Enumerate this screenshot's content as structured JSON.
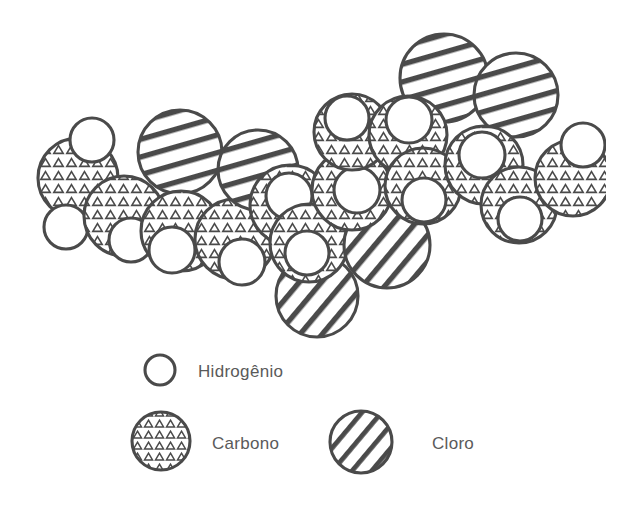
{
  "figure": {
    "title": "",
    "kind": "space-filling molecular model",
    "background_color": "#ffffff",
    "ink_color": "#4a4a4a"
  },
  "legend": {
    "items": [
      {
        "key": "hidrogenio",
        "label": "Hidrogênio",
        "fill_style": "plain",
        "radius": 15,
        "swatch_cx": 160,
        "swatch_cy": 370,
        "label_x": 198,
        "label_y": 377
      },
      {
        "key": "carbono",
        "label": "Carbono",
        "fill_style": "triangles",
        "radius": 29,
        "swatch_cx": 161,
        "swatch_cy": 441,
        "label_x": 212,
        "label_y": 449
      },
      {
        "key": "cloro",
        "label": "Cloro",
        "fill_style": "stripes",
        "radius": 31,
        "swatch_cx": 361,
        "swatch_cy": 442,
        "label_x": 432,
        "label_y": 449
      }
    ]
  },
  "molecule": {
    "atoms": [
      {
        "id": "c1",
        "element": "carbono",
        "cx": 78,
        "cy": 178,
        "r": 40,
        "stripe_angle": 0
      },
      {
        "id": "h1",
        "element": "hidrogenio",
        "cx": 92,
        "cy": 140,
        "r": 22,
        "stripe_angle": 0
      },
      {
        "id": "h2",
        "element": "hidrogenio",
        "cx": 66,
        "cy": 227,
        "r": 22,
        "stripe_angle": 0
      },
      {
        "id": "c2",
        "element": "carbono",
        "cx": 124,
        "cy": 216,
        "r": 40,
        "stripe_angle": 0
      },
      {
        "id": "h3",
        "element": "hidrogenio",
        "cx": 131,
        "cy": 240,
        "r": 22,
        "stripe_angle": 0
      },
      {
        "id": "cl1",
        "element": "cloro",
        "cx": 180,
        "cy": 152,
        "r": 42,
        "stripe_angle": 78
      },
      {
        "id": "c3",
        "element": "carbono",
        "cx": 181,
        "cy": 231,
        "r": 40,
        "stripe_angle": 0
      },
      {
        "id": "h4",
        "element": "hidrogenio",
        "cx": 172,
        "cy": 250,
        "r": 23,
        "stripe_angle": 0
      },
      {
        "id": "c4",
        "element": "carbono",
        "cx": 235,
        "cy": 239,
        "r": 40,
        "stripe_angle": 0
      },
      {
        "id": "h5",
        "element": "hidrogenio",
        "cx": 242,
        "cy": 262,
        "r": 23,
        "stripe_angle": 0
      },
      {
        "id": "cl2",
        "element": "cloro",
        "cx": 258,
        "cy": 170,
        "r": 40,
        "stripe_angle": 76
      },
      {
        "id": "c5",
        "element": "carbono",
        "cx": 290,
        "cy": 205,
        "r": 40,
        "stripe_angle": 0
      },
      {
        "id": "h6",
        "element": "hidrogenio",
        "cx": 289,
        "cy": 196,
        "r": 23,
        "stripe_angle": 0
      },
      {
        "id": "cl3",
        "element": "cloro",
        "cx": 317,
        "cy": 296,
        "r": 41,
        "stripe_angle": 35
      },
      {
        "id": "c6",
        "element": "carbono",
        "cx": 309,
        "cy": 243,
        "r": 39,
        "stripe_angle": 0
      },
      {
        "id": "h7",
        "element": "hidrogenio",
        "cx": 307,
        "cy": 253,
        "r": 22,
        "stripe_angle": 0
      },
      {
        "id": "cl4",
        "element": "cloro",
        "cx": 387,
        "cy": 245,
        "r": 43,
        "stripe_angle": 42
      },
      {
        "id": "c7",
        "element": "carbono",
        "cx": 352,
        "cy": 190,
        "r": 40,
        "stripe_angle": 0
      },
      {
        "id": "h8",
        "element": "hidrogenio",
        "cx": 357,
        "cy": 190,
        "r": 23,
        "stripe_angle": 0
      },
      {
        "id": "c8",
        "element": "carbono",
        "cx": 352,
        "cy": 132,
        "r": 38,
        "stripe_angle": 0
      },
      {
        "id": "h9",
        "element": "hidrogenio",
        "cx": 347,
        "cy": 118,
        "r": 22,
        "stripe_angle": 0
      },
      {
        "id": "cl5",
        "element": "cloro",
        "cx": 444,
        "cy": 78,
        "r": 44,
        "stripe_angle": 74
      },
      {
        "id": "c9",
        "element": "carbono",
        "cx": 408,
        "cy": 135,
        "r": 39,
        "stripe_angle": 0
      },
      {
        "id": "h10",
        "element": "hidrogenio",
        "cx": 409,
        "cy": 120,
        "r": 23,
        "stripe_angle": 0
      },
      {
        "id": "c10",
        "element": "carbono",
        "cx": 423,
        "cy": 186,
        "r": 38,
        "stripe_angle": 0
      },
      {
        "id": "h11",
        "element": "hidrogenio",
        "cx": 424,
        "cy": 200,
        "r": 22,
        "stripe_angle": 0
      },
      {
        "id": "cl6",
        "element": "cloro",
        "cx": 516,
        "cy": 95,
        "r": 42,
        "stripe_angle": 74
      },
      {
        "id": "c11",
        "element": "carbono",
        "cx": 484,
        "cy": 165,
        "r": 39,
        "stripe_angle": 0
      },
      {
        "id": "h12",
        "element": "hidrogenio",
        "cx": 482,
        "cy": 155,
        "r": 23,
        "stripe_angle": 0
      },
      {
        "id": "c12",
        "element": "carbono",
        "cx": 519,
        "cy": 205,
        "r": 38,
        "stripe_angle": 0
      },
      {
        "id": "h13",
        "element": "hidrogenio",
        "cx": 520,
        "cy": 219,
        "r": 22,
        "stripe_angle": 0
      },
      {
        "id": "c13",
        "element": "carbono",
        "cx": 573,
        "cy": 178,
        "r": 38,
        "stripe_angle": 0
      },
      {
        "id": "h14",
        "element": "hidrogenio",
        "cx": 583,
        "cy": 145,
        "r": 22,
        "stripe_angle": 0
      }
    ]
  }
}
